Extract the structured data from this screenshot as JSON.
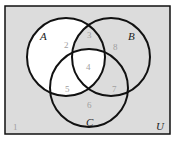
{
  "diagram": {
    "type": "venn-3",
    "colors": {
      "background": "#dcdcdc",
      "shaded": "#ffffff",
      "stroke": "#111111",
      "region_number": "#a0a0a0",
      "label": "#222222"
    },
    "universe_label": "U",
    "sets": [
      {
        "label": "A"
      },
      {
        "label": "B"
      },
      {
        "label": "C"
      }
    ],
    "regions": [
      {
        "number": "1",
        "description": "outside A, B, C"
      },
      {
        "number": "2",
        "description": "A only"
      },
      {
        "number": "3",
        "description": "A and B, not C"
      },
      {
        "number": "4",
        "description": "A and B and C"
      },
      {
        "number": "5",
        "description": "A and C, not B"
      },
      {
        "number": "6",
        "description": "C only"
      },
      {
        "number": "7",
        "description": "B and C, not A"
      },
      {
        "number": "8",
        "description": "B only"
      }
    ],
    "shaded_regions": [
      "2",
      "4",
      "5"
    ]
  }
}
